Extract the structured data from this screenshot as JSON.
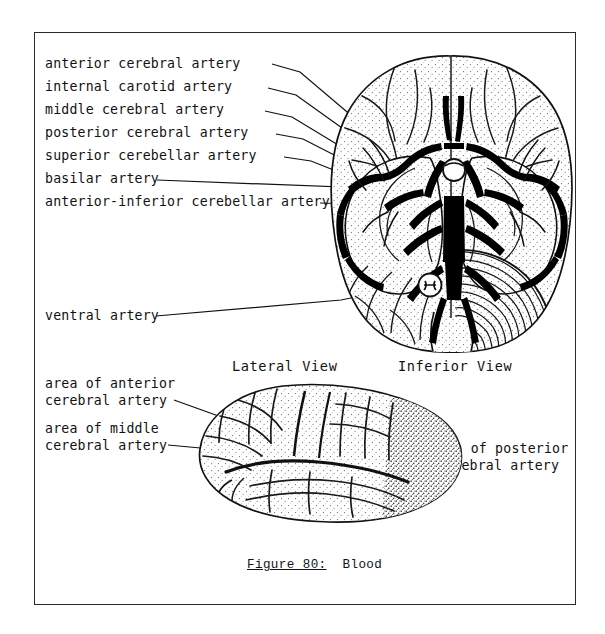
{
  "figure": {
    "caption_number": "Figure 80:",
    "caption_title": "Blood",
    "border_color": "#2b2b2b",
    "ink_color": "#111111"
  },
  "views": {
    "inferior": {
      "title": "Inferior View",
      "labels": [
        {
          "id": "anterior-cerebral-artery",
          "text": "anterior cerebral artery"
        },
        {
          "id": "internal-carotid-artery",
          "text": "internal carotid artery"
        },
        {
          "id": "middle-cerebral-artery",
          "text": "middle cerebral artery"
        },
        {
          "id": "posterior-cerebral-artery",
          "text": "posterior cerebral artery"
        },
        {
          "id": "superior-cerebellar-artery",
          "text": "superior cerebellar artery"
        },
        {
          "id": "basilar-artery",
          "text": "basilar artery"
        },
        {
          "id": "anterior-inferior-cerebellar-artery",
          "text": "anterior-inferior cerebellar artery"
        },
        {
          "id": "ventral-artery",
          "text": "ventral artery"
        }
      ]
    },
    "lateral": {
      "title": "Lateral View",
      "labels": [
        {
          "id": "area-anterior-cerebral-artery",
          "line1": "area of anterior",
          "line2": "cerebral artery"
        },
        {
          "id": "area-middle-cerebral-artery",
          "line1": "area of middle",
          "line2": "cerebral artery"
        },
        {
          "id": "area-posterior-cerebral-artery",
          "line1": "area of posterior",
          "line2": "cerebral artery"
        }
      ]
    }
  }
}
